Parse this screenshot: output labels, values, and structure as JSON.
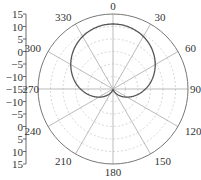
{
  "chart_data": {
    "type": "polar-line",
    "title": "",
    "center_px": [
      113,
      89
    ],
    "outer_radius_px": 75,
    "radial_axis": {
      "range": [
        -15,
        15
      ],
      "tick_labels": [
        "15",
        "10",
        "5",
        "0",
        "-5",
        "-10",
        "-15",
        "-10",
        "-5",
        "0",
        "5",
        "10",
        "15"
      ],
      "ring_step": 5
    },
    "angular_axis": {
      "direction": "clockwise",
      "zero_at": "top",
      "tick_labels": [
        "0",
        "30",
        "60",
        "90",
        "120",
        "150",
        "180",
        "210",
        "240",
        "270",
        "300",
        "330"
      ],
      "tick_values": [
        0,
        30,
        60,
        90,
        120,
        150,
        180,
        210,
        240,
        270,
        300,
        330
      ]
    },
    "series": [
      {
        "name": "pattern",
        "shape": "cardioid",
        "formula": "r = -15 + 13*(1+cos(theta))",
        "max_value": 11,
        "min_value": -15,
        "color": "#555555"
      }
    ],
    "colors": {
      "curve": "#555555",
      "outer_circle": "#777777",
      "spokes": "#aaaaaa",
      "rings": "#cccccc",
      "axis": "#444444",
      "text": "#333333"
    }
  }
}
